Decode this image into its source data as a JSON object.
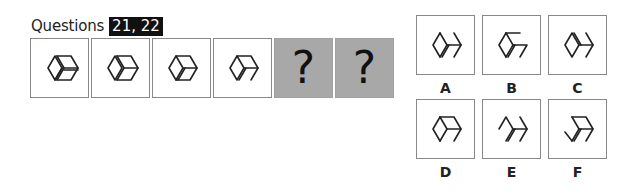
{
  "header": {
    "label": "Questions",
    "badge": "21, 22"
  },
  "sequence": [
    {
      "type": "figure",
      "name": "cube-double-left-double-mid"
    },
    {
      "type": "figure",
      "name": "cube-double-left"
    },
    {
      "type": "figure",
      "name": "cube-double-bottom"
    },
    {
      "type": "figure",
      "name": "cube-open-right"
    },
    {
      "type": "unknown",
      "symbol": "?"
    },
    {
      "type": "unknown",
      "symbol": "?"
    }
  ],
  "options": [
    {
      "label": "A"
    },
    {
      "label": "B"
    },
    {
      "label": "C"
    },
    {
      "label": "D"
    },
    {
      "label": "E"
    },
    {
      "label": "F"
    }
  ],
  "colors": {
    "unknown_box": "#a8a8a8",
    "badge_bg": "#111111",
    "stroke": "#222222"
  }
}
